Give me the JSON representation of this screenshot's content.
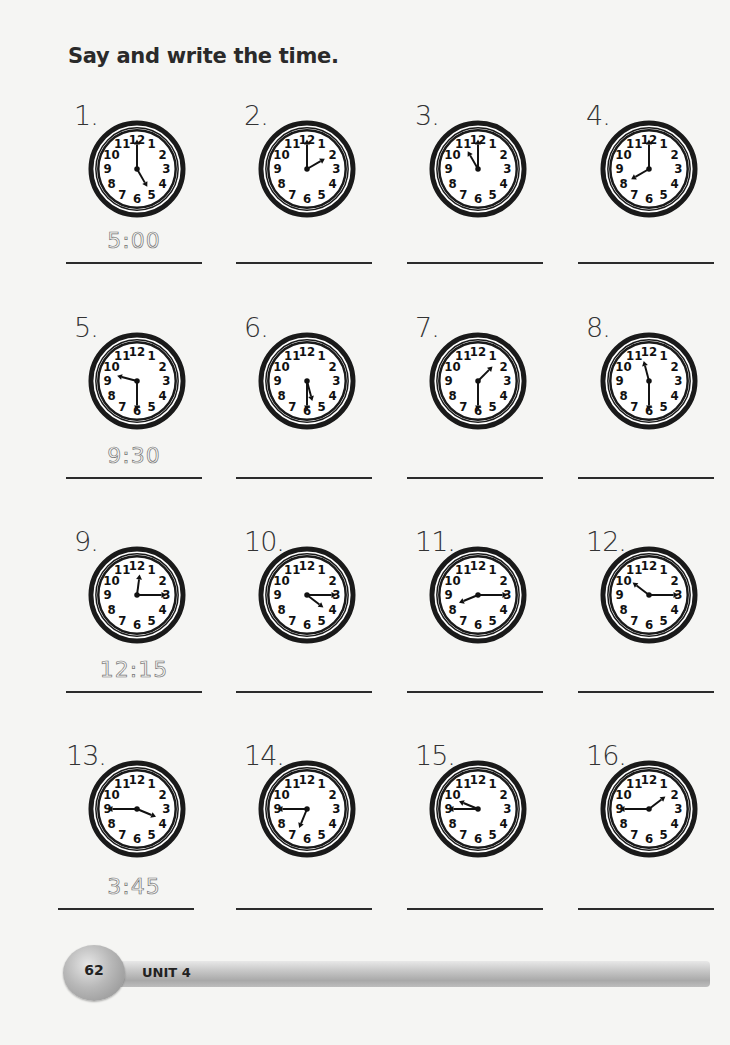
{
  "title": "Say and write the time.",
  "footer": {
    "page_number": "62",
    "unit_label": "UNIT 4"
  },
  "clock_numerals": [
    "12",
    "1",
    "2",
    "3",
    "4",
    "5",
    "6",
    "7",
    "8",
    "9",
    "10",
    "11"
  ],
  "items": [
    {
      "number": "1.",
      "hour": 5,
      "minute": 0,
      "answer": "5:00"
    },
    {
      "number": "2.",
      "hour": 2,
      "minute": 0,
      "answer": ""
    },
    {
      "number": "3.",
      "hour": 11,
      "minute": 0,
      "answer": ""
    },
    {
      "number": "4.",
      "hour": 8,
      "minute": 0,
      "answer": ""
    },
    {
      "number": "5.",
      "hour": 9,
      "minute": 30,
      "answer": "9:30"
    },
    {
      "number": "6.",
      "hour": 5,
      "minute": 30,
      "answer": ""
    },
    {
      "number": "7.",
      "hour": 1,
      "minute": 30,
      "answer": ""
    },
    {
      "number": "8.",
      "hour": 11,
      "minute": 30,
      "answer": ""
    },
    {
      "number": "9.",
      "hour": 12,
      "minute": 15,
      "answer": "12:15"
    },
    {
      "number": "10.",
      "hour": 4,
      "minute": 15,
      "answer": ""
    },
    {
      "number": "11.",
      "hour": 8,
      "minute": 15,
      "answer": ""
    },
    {
      "number": "12.",
      "hour": 10,
      "minute": 15,
      "answer": ""
    },
    {
      "number": "13.",
      "hour": 3,
      "minute": 45,
      "answer": "3:45"
    },
    {
      "number": "14.",
      "hour": 6,
      "minute": 45,
      "answer": ""
    },
    {
      "number": "15.",
      "hour": 9,
      "minute": 45,
      "answer": ""
    },
    {
      "number": "16.",
      "hour": 1,
      "minute": 45,
      "answer": ""
    }
  ]
}
